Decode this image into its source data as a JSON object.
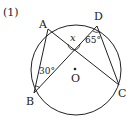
{
  "problem_number": "(1)",
  "points": {
    "A": {
      "label": "A",
      "x": 48,
      "y": 29
    },
    "B": {
      "label": "B",
      "x": 34,
      "y": 93
    },
    "C": {
      "label": "C",
      "x": 119,
      "y": 85
    },
    "D": {
      "label": "D",
      "x": 97,
      "y": 26
    },
    "O": {
      "label": "O",
      "x": 75,
      "y": 69
    }
  },
  "circle": {
    "cx": 76,
    "cy": 70,
    "r": 45
  },
  "angles": {
    "x": "x",
    "d": "65°",
    "b": "30°"
  },
  "colors": {
    "stroke": "#222222"
  }
}
